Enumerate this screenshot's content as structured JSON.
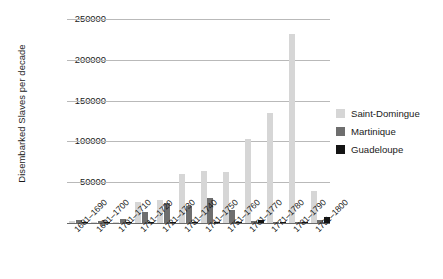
{
  "chart_data": {
    "type": "bar",
    "title": "",
    "xlabel": "",
    "ylabel": "Disembarked Slaves per decade",
    "ylim": [
      0,
      250000
    ],
    "ytick_labels": [
      "250000",
      "200000",
      "150000",
      "100000",
      "50000",
      "0"
    ],
    "ytick_values": [
      250000,
      200000,
      150000,
      100000,
      50000,
      0
    ],
    "grid": true,
    "legend_position": "right",
    "categories": [
      "1681–1690",
      "1691–1700",
      "1701–1710",
      "1711–1720",
      "1721–1730",
      "1731–1740",
      "1741–1750",
      "1751–1760",
      "1761–1770",
      "1771–1780",
      "1781–1790",
      "1791–1800"
    ],
    "series": [
      {
        "name": "Saint-Domingue",
        "color": "#d6d6d6",
        "values": [
          2500,
          1200,
          1500,
          26000,
          28000,
          60000,
          64000,
          63000,
          103000,
          135000,
          232000,
          39000
        ]
      },
      {
        "name": "Martinique",
        "color": "#6e6e6e",
        "values": [
          4000,
          2000,
          5000,
          14000,
          25000,
          21000,
          31000,
          15500,
          2500,
          1800,
          1000,
          3500
        ]
      },
      {
        "name": "Guadeloupe",
        "color": "#141414",
        "values": [
          300,
          200,
          300,
          700,
          400,
          500,
          400,
          600,
          3800,
          1500,
          900,
          7000
        ]
      }
    ]
  },
  "legend": {
    "items": [
      {
        "label": "Saint-Domingue",
        "color": "#d6d6d6"
      },
      {
        "label": "Martinique",
        "color": "#6e6e6e"
      },
      {
        "label": "Guadeloupe",
        "color": "#141414"
      }
    ]
  }
}
